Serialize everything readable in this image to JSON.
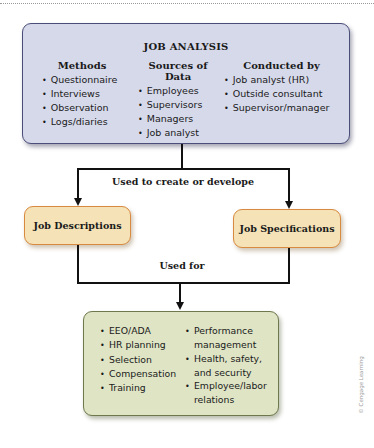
{
  "job_analysis": {
    "title": "JOB ANALYSIS",
    "columns": [
      {
        "heading": "Methods",
        "items": [
          "Questionnaire",
          "Interviews",
          "Observation",
          "Logs/diaries"
        ]
      },
      {
        "heading": "Sources of Data",
        "items": [
          "Employees",
          "Supervisors",
          "Managers",
          "Job analyst"
        ]
      },
      {
        "heading": "Conducted by",
        "items": [
          "Job analyst (HR)",
          "Outside consultant",
          "Supervisor/manager"
        ]
      }
    ]
  },
  "connector_labels": {
    "create": "Used to create or develope",
    "used_for": "Used for"
  },
  "outputs": {
    "descriptions": "Job Descriptions",
    "specifications": "Job Specifications"
  },
  "uses": {
    "left": [
      "EEO/ADA",
      "HR planning",
      "Selection",
      "Compensation",
      "Training"
    ],
    "right": [
      "Performance management",
      "Health, safety, and security",
      "Employee/labor relations"
    ]
  },
  "copyright": "© Cengage Learning",
  "colors": {
    "analysis_fill": "#d6d9ea",
    "analysis_border": "#4b4e78",
    "output_fill": "#f5e2b6",
    "output_border": "#d88a40",
    "uses_fill": "#dfe4c5",
    "uses_border": "#6d784c"
  }
}
